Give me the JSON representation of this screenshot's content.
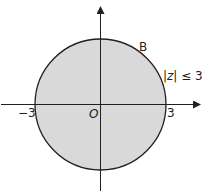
{
  "diagram": {
    "type": "argand-diagram-region",
    "region": {
      "shape": "disc",
      "label": "B",
      "condition": "|z| ≤ 3",
      "condition_parts": {
        "bar_left": "|",
        "var": "z",
        "bar_right": "|",
        "rest": " ≤ 3"
      },
      "fill_color": "#d9d9d9",
      "boundary_color": "#231f20"
    },
    "axes": {
      "origin_label": "O",
      "x_ticks": [
        {
          "value": -3,
          "label": "−3"
        },
        {
          "value": 3,
          "label": "3"
        }
      ],
      "color": "#231f20"
    }
  }
}
